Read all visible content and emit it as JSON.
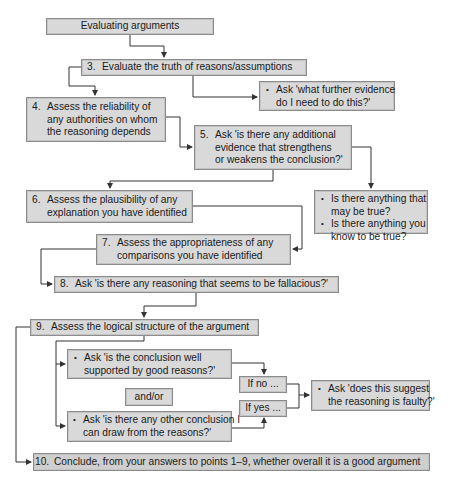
{
  "diagram": {
    "title": "Evaluating arguments",
    "steps": {
      "s3": {
        "num": "3.",
        "text": "Evaluate the truth of reasons/assumptions"
      },
      "s3_note": {
        "bullets": [
          "Ask 'what further evidence",
          "do I need to do this?'"
        ]
      },
      "s4": {
        "num": "4.",
        "lines": [
          "Assess the reliability of",
          "any authorities on whom",
          "the reasoning depends"
        ]
      },
      "s5": {
        "num": "5.",
        "lines": [
          "Ask 'is there any additional",
          "evidence that strengthens",
          "or weakens the conclusion?'"
        ]
      },
      "s5_note": {
        "bullets": [
          {
            "l1": "Is there anything that",
            "l2": "may be true?"
          },
          {
            "l1": "Is there anything you",
            "l2": "know to be true?"
          }
        ]
      },
      "s6": {
        "num": "6.",
        "lines": [
          "Assess the plausibility of any",
          "explanation you have identified"
        ]
      },
      "s7": {
        "num": "7.",
        "lines": [
          "Assess the appropriateness of any",
          "comparisons you have identified"
        ]
      },
      "s8": {
        "num": "8.",
        "text": "Ask 'is there any reasoning that seems to be fallacious?'"
      },
      "s9": {
        "num": "9.",
        "text": "Assess the logical structure of the argument"
      },
      "s9a": {
        "l1": "Ask 'is the conclusion well",
        "l2": "supported by good reasons?'"
      },
      "andor": "and/or",
      "s9b": {
        "l1": "Ask 'is there any other conclusion I",
        "l2": "can draw from the reasons?'"
      },
      "if_no": "If no ...",
      "if_yes": "If yes ...",
      "faulty": {
        "l1": "Ask 'does this suggest",
        "l2": "the reasoning is faulty?'"
      },
      "s10": {
        "num": "10.",
        "text": "Conclude, from your answers to points 1–9, whether overall it is a good argument"
      }
    }
  },
  "colors": {
    "box_fill": "#d9d9d9",
    "box_border": "#8c8c8c",
    "line": "#333333",
    "text": "#1a1a1a"
  }
}
